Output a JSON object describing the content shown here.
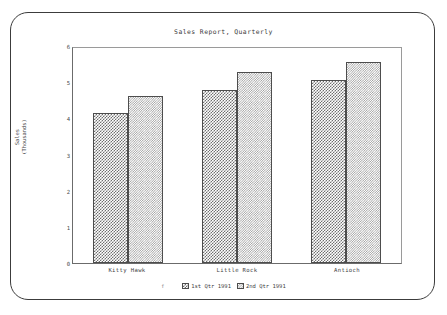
{
  "chart_data": {
    "type": "bar",
    "title": "Sales Report, Quarterly",
    "xlabel": "",
    "ylabel": "Sales\n(Thousands)",
    "categories": [
      "Kitty Hawk",
      "Little Rock",
      "Antioch"
    ],
    "series": [
      {
        "name": "1st Qtr 1991",
        "values": [
          4.2,
          4.83,
          5.12
        ],
        "pattern": "checker-dot",
        "color": "#6f6f6f"
      },
      {
        "name": "2nd Qtr 1991",
        "values": [
          4.65,
          5.33,
          5.6
        ],
        "pattern": "diagonal-hatch",
        "color": "#9d9d9d"
      }
    ],
    "ylim": [
      0,
      6
    ],
    "yticks": [
      "0",
      "1",
      "2",
      "3",
      "4",
      "5",
      "6"
    ],
    "grid": false,
    "legend_position": "bottom",
    "legend_marker": "f"
  },
  "frame": {
    "border_color": "#3c3c3c"
  }
}
